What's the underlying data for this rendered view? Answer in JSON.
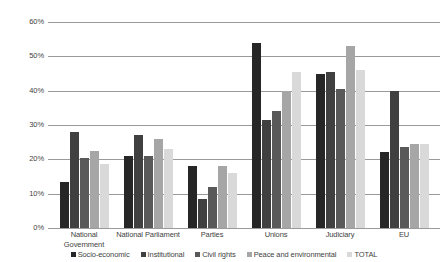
{
  "chart_data": {
    "type": "bar",
    "title": "",
    "subtitle": "",
    "xlabel": "",
    "ylabel": "",
    "ylim": [
      0,
      60
    ],
    "ytick_step": 10,
    "ytick_labels": [
      "60%",
      "50%",
      "40%",
      "30%",
      "20%",
      "10%",
      "0%"
    ],
    "ytick_values": [
      60,
      50,
      40,
      30,
      20,
      10,
      0
    ],
    "grid": true,
    "legend_position": "bottom",
    "value_suffix": "%",
    "categories": [
      "National Government",
      "National Parliament",
      "Parties",
      "Unions",
      "Judiciary",
      "EU"
    ],
    "category_label_lines": [
      [
        "National",
        "Government"
      ],
      [
        "National Parliament"
      ],
      [
        "Parties"
      ],
      [
        "Unions"
      ],
      [
        "Judiciary"
      ],
      [
        "EU"
      ]
    ],
    "series": [
      {
        "name": "Socio-economic",
        "color": "#262626",
        "values": [
          13.5,
          21.0,
          18.0,
          54.0,
          45.0,
          22.0
        ]
      },
      {
        "name": "Institutional",
        "color": "#404040",
        "values": [
          28.0,
          27.0,
          8.5,
          31.5,
          45.5,
          40.0
        ]
      },
      {
        "name": "Civil rights",
        "color": "#595959",
        "values": [
          20.5,
          21.0,
          12.0,
          34.0,
          40.5,
          23.5
        ]
      },
      {
        "name": "Peace and environmental",
        "color": "#a6a6a6",
        "values": [
          22.5,
          26.0,
          18.0,
          40.0,
          53.0,
          24.5
        ]
      },
      {
        "name": "TOTAL",
        "color": "#d9d9d9",
        "values": [
          18.5,
          23.0,
          16.0,
          45.5,
          46.0,
          24.5
        ]
      }
    ]
  },
  "colors": {
    "gridline": "#9a9a9a",
    "text": "#3f3f3f",
    "background": "#ffffff"
  }
}
